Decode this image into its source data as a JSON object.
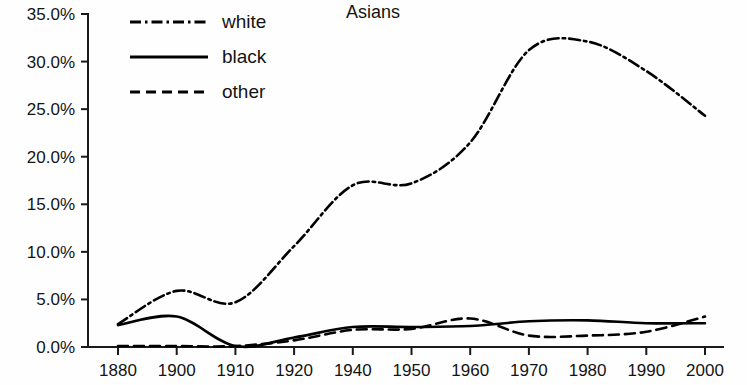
{
  "chart_data": {
    "type": "line",
    "title": "Asians",
    "xlabel": "",
    "ylabel": "",
    "grid": false,
    "legend_position": "top-left",
    "categories": [
      "1880",
      "1900",
      "1910",
      "1920",
      "1940",
      "1950",
      "1960",
      "1970",
      "1980",
      "1990",
      "2000"
    ],
    "x": [
      1880,
      1900,
      1910,
      1920,
      1940,
      1950,
      1960,
      1970,
      1980,
      1990,
      2000
    ],
    "ylim": [
      0,
      35
    ],
    "y_tick_labels": [
      "0.0%",
      "5.0%",
      "10.0%",
      "15.0%",
      "20.0%",
      "25.0%",
      "30.0%",
      "35.0%"
    ],
    "y_tick_values": [
      0,
      5,
      10,
      15,
      20,
      25,
      30,
      35
    ],
    "y_unit": "%",
    "series": [
      {
        "name": "white",
        "style": "dash-dot",
        "color": "#000000",
        "values": [
          2.4,
          5.9,
          4.7,
          10.6,
          17.0,
          17.2,
          21.5,
          31.2,
          32.1,
          29.0,
          24.3
        ]
      },
      {
        "name": "black",
        "style": "solid",
        "color": "#000000",
        "values": [
          2.3,
          3.2,
          0.1,
          1.0,
          2.1,
          2.1,
          2.2,
          2.7,
          2.8,
          2.5,
          2.5
        ]
      },
      {
        "name": "other",
        "style": "dashed",
        "color": "#000000",
        "values": [
          0.1,
          0.1,
          0.1,
          0.7,
          1.8,
          1.9,
          3.0,
          1.2,
          1.2,
          1.6,
          3.2
        ]
      }
    ]
  },
  "legend": {
    "entries": [
      {
        "label": "white",
        "style": "dash-dot"
      },
      {
        "label": "black",
        "style": "solid"
      },
      {
        "label": "other",
        "style": "dashed"
      }
    ]
  },
  "axes": {
    "y_axis_x_px": 88,
    "y_top_px": 14,
    "y_bottom_px": 347,
    "x_left_px": 118,
    "x_right_px": 705
  }
}
